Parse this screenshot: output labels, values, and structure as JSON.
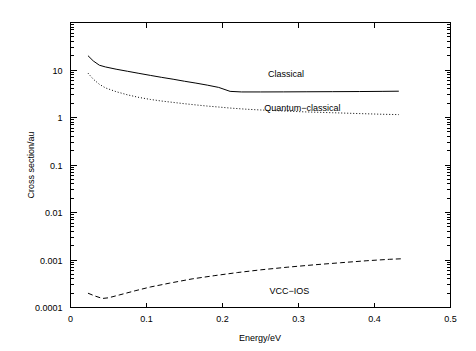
{
  "chart_data": {
    "type": "line",
    "title": "",
    "xlabel": "Energy/eV",
    "ylabel": "Cross section/au",
    "xscale": "linear",
    "yscale": "log",
    "xlim": [
      0,
      0.5
    ],
    "ylim": [
      0.0001,
      100
    ],
    "grid": false,
    "legend_position": "inline-annotations",
    "xticks": [
      0,
      0.1,
      0.2,
      0.3,
      0.4,
      0.5
    ],
    "xticklabels": [
      "0",
      "0.1",
      "0.2",
      "0.3",
      "0.4",
      "0.5"
    ],
    "yticks": [
      0.0001,
      0.001,
      0.01,
      0.1,
      1,
      10
    ],
    "yticklabels": [
      "0.0001",
      "0.001",
      "0.01",
      "0.1",
      "1",
      "10"
    ],
    "minor_yticks": true,
    "series": [
      {
        "name": "Classical",
        "style": "solid",
        "label_text": "Classical",
        "label_x": 0.26,
        "label_y": 7.0,
        "x": [
          0.023,
          0.03,
          0.038,
          0.046,
          0.06,
          0.075,
          0.09,
          0.105,
          0.12,
          0.135,
          0.15,
          0.165,
          0.18,
          0.195,
          0.21,
          0.225,
          0.25,
          0.28,
          0.31,
          0.345,
          0.38,
          0.41,
          0.432
        ],
        "y": [
          20.0,
          15.5,
          12.6,
          11.6,
          10.4,
          9.4,
          8.5,
          7.7,
          7.0,
          6.4,
          5.8,
          5.3,
          4.8,
          4.3,
          3.55,
          3.45,
          3.45,
          3.46,
          3.48,
          3.5,
          3.52,
          3.55,
          3.58
        ]
      },
      {
        "name": "Quantum-classical",
        "style": "dotted",
        "label_text": "Quantum−classical",
        "label_x": 0.255,
        "label_y": 1.35,
        "x": [
          0.023,
          0.03,
          0.038,
          0.046,
          0.06,
          0.075,
          0.09,
          0.105,
          0.12,
          0.135,
          0.15,
          0.165,
          0.18,
          0.195,
          0.21,
          0.23,
          0.25,
          0.28,
          0.31,
          0.345,
          0.38,
          0.41,
          0.432
        ],
        "y": [
          8.6,
          6.4,
          5.0,
          4.2,
          3.5,
          3.0,
          2.65,
          2.4,
          2.22,
          2.08,
          1.95,
          1.84,
          1.74,
          1.66,
          1.58,
          1.5,
          1.44,
          1.37,
          1.31,
          1.26,
          1.21,
          1.17,
          1.15
        ]
      },
      {
        "name": "VCC-IOS",
        "style": "dashed",
        "label_text": "VCC−IOS",
        "label_x": 0.262,
        "label_y": 0.00019,
        "x": [
          0.023,
          0.032,
          0.042,
          0.05,
          0.065,
          0.085,
          0.105,
          0.13,
          0.16,
          0.19,
          0.22,
          0.25,
          0.285,
          0.32,
          0.355,
          0.39,
          0.42,
          0.435
        ],
        "y": [
          0.0002,
          0.000175,
          0.000155,
          0.00016,
          0.000185,
          0.000225,
          0.00027,
          0.000325,
          0.0004,
          0.00047,
          0.000545,
          0.00062,
          0.000705,
          0.00079,
          0.000875,
          0.000965,
          0.001035,
          0.00106
        ]
      }
    ]
  },
  "colors": {
    "background": "#ffffff",
    "foreground": "#000000"
  }
}
